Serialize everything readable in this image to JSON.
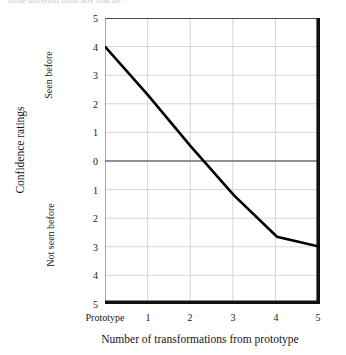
{
  "page": {
    "cropped_text_above": "quite different from any that he"
  },
  "chart_data": {
    "type": "line",
    "title": "",
    "xlabel": "Number of transformations from prototype",
    "ylabel": "Confidence ratings",
    "categories": [
      "Prototype",
      "1",
      "2",
      "3",
      "4",
      "5"
    ],
    "x_tick_labels": [
      "Prototype",
      "1",
      "2",
      "3",
      "4",
      "5"
    ],
    "y_tick_labels": [
      "5",
      "4",
      "3",
      "2",
      "1",
      "0",
      "1",
      "2",
      "3",
      "4",
      "5"
    ],
    "y_tick_values": [
      5,
      4,
      3,
      2,
      1,
      0,
      -1,
      -2,
      -3,
      -4,
      -5
    ],
    "ylim": [
      -5,
      5
    ],
    "xlim": [
      0,
      5
    ],
    "grid": true,
    "legend": "none",
    "series": [
      {
        "name": "Confidence rating",
        "values": [
          4.0,
          2.3,
          0.5,
          -1.2,
          -2.65,
          -3.0
        ],
        "color": "#000000"
      }
    ],
    "annotations": {
      "upper_half_label": "Seen before",
      "lower_half_label": "Not seen before",
      "zero_line": 0
    }
  },
  "colors": {
    "line": "#000000",
    "grid": "#d6d6d6",
    "axis": "#666666",
    "frame": "#000000",
    "text": "#161616"
  }
}
